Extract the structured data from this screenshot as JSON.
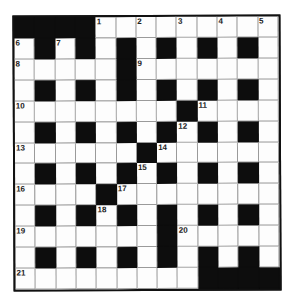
{
  "puzzle": {
    "type": "crossword",
    "size": {
      "rows": 13,
      "cols": 13
    },
    "colors": {
      "black": "#0d0d0d",
      "white": "#fdfdfd",
      "border": "#111111"
    },
    "layout": [
      "#### .........",
      ".#.#.#.#.#.#.",
      ".....#.......",
      ".#.#.#.#.#.#.",
      "........#....",
      ".#.#.#.#.#.#.",
      "......#......",
      ".#.#.#.#.#.#.",
      "....#........",
      ".#.#.#.#.#.#.",
      ".......#.....",
      ".#.#.#.#.#.#.",
      ".........####"
    ],
    "numbers": [
      {
        "n": "1",
        "r": 0,
        "c": 4
      },
      {
        "n": "2",
        "r": 0,
        "c": 6
      },
      {
        "n": "3",
        "r": 0,
        "c": 8
      },
      {
        "n": "4",
        "r": 0,
        "c": 10
      },
      {
        "n": "5",
        "r": 0,
        "c": 12
      },
      {
        "n": "6",
        "r": 1,
        "c": 0
      },
      {
        "n": "7",
        "r": 1,
        "c": 2
      },
      {
        "n": "8",
        "r": 2,
        "c": 0
      },
      {
        "n": "9",
        "r": 2,
        "c": 6
      },
      {
        "n": "10",
        "r": 4,
        "c": 0
      },
      {
        "n": "11",
        "r": 4,
        "c": 9
      },
      {
        "n": "12",
        "r": 5,
        "c": 8
      },
      {
        "n": "13",
        "r": 6,
        "c": 0
      },
      {
        "n": "14",
        "r": 6,
        "c": 7
      },
      {
        "n": "15",
        "r": 7,
        "c": 6
      },
      {
        "n": "16",
        "r": 8,
        "c": 0
      },
      {
        "n": "17",
        "r": 8,
        "c": 5
      },
      {
        "n": "18",
        "r": 9,
        "c": 4
      },
      {
        "n": "19",
        "r": 10,
        "c": 0
      },
      {
        "n": "20",
        "r": 10,
        "c": 8
      },
      {
        "n": "21",
        "r": 12,
        "c": 0
      }
    ]
  }
}
